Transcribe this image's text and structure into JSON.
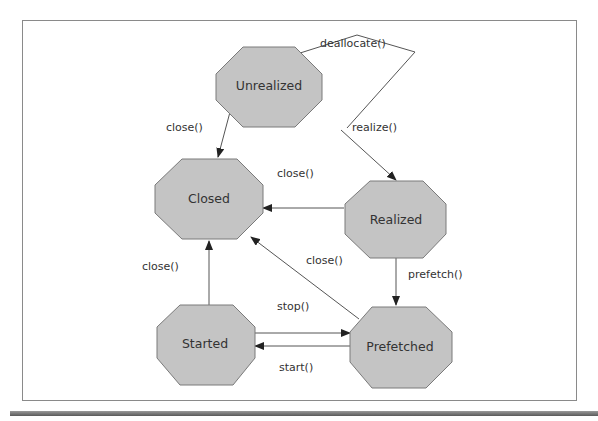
{
  "diagram": {
    "type": "state-diagram",
    "colors": {
      "state_fill": "#c4c4c4",
      "state_stroke": "#7a7a7a",
      "edge": "#555555",
      "text": "#333333",
      "frame": "#8a8a8a"
    },
    "states": [
      {
        "id": "unrealized",
        "label": "Unrealized"
      },
      {
        "id": "closed",
        "label": "Closed"
      },
      {
        "id": "realized",
        "label": "Realized"
      },
      {
        "id": "started",
        "label": "Started"
      },
      {
        "id": "prefetched",
        "label": "Prefetched"
      }
    ],
    "transitions": [
      {
        "from": "unrealized",
        "to": "unrealized",
        "label": "deallocate()"
      },
      {
        "from": "unrealized",
        "to": "closed",
        "label": "close()"
      },
      {
        "from": "unrealized",
        "to": "realized",
        "label": "realize()"
      },
      {
        "from": "realized",
        "to": "closed",
        "label": "close()"
      },
      {
        "from": "realized",
        "to": "prefetched",
        "label": "prefetch()"
      },
      {
        "from": "prefetched",
        "to": "closed",
        "label": "close()"
      },
      {
        "from": "started",
        "to": "closed",
        "label": "close()"
      },
      {
        "from": "started",
        "to": "prefetched",
        "label": "stop()"
      },
      {
        "from": "prefetched",
        "to": "started",
        "label": "start()"
      }
    ]
  }
}
